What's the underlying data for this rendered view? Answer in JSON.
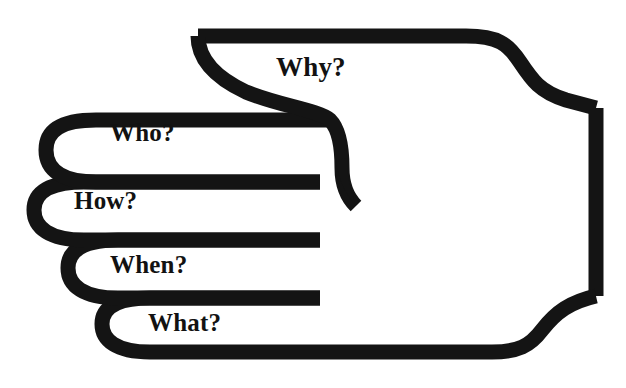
{
  "figure": {
    "type": "line-art-illustration",
    "stroke_color": "#141414",
    "background_color": "#ffffff",
    "width": 626,
    "height": 388
  },
  "labels": {
    "thumb": "Why?",
    "index": "Who?",
    "middle": "How?",
    "ring": "When?",
    "pinky": "What?"
  },
  "parts": [
    {
      "id": "thumb",
      "name": "thumb-finger",
      "label": "Why?"
    },
    {
      "id": "index",
      "name": "index-finger",
      "label": "Who?"
    },
    {
      "id": "middle",
      "name": "middle-finger",
      "label": "How?"
    },
    {
      "id": "ring",
      "name": "ring-finger",
      "label": "When?"
    },
    {
      "id": "pinky",
      "name": "pinky-finger",
      "label": "What?"
    }
  ]
}
